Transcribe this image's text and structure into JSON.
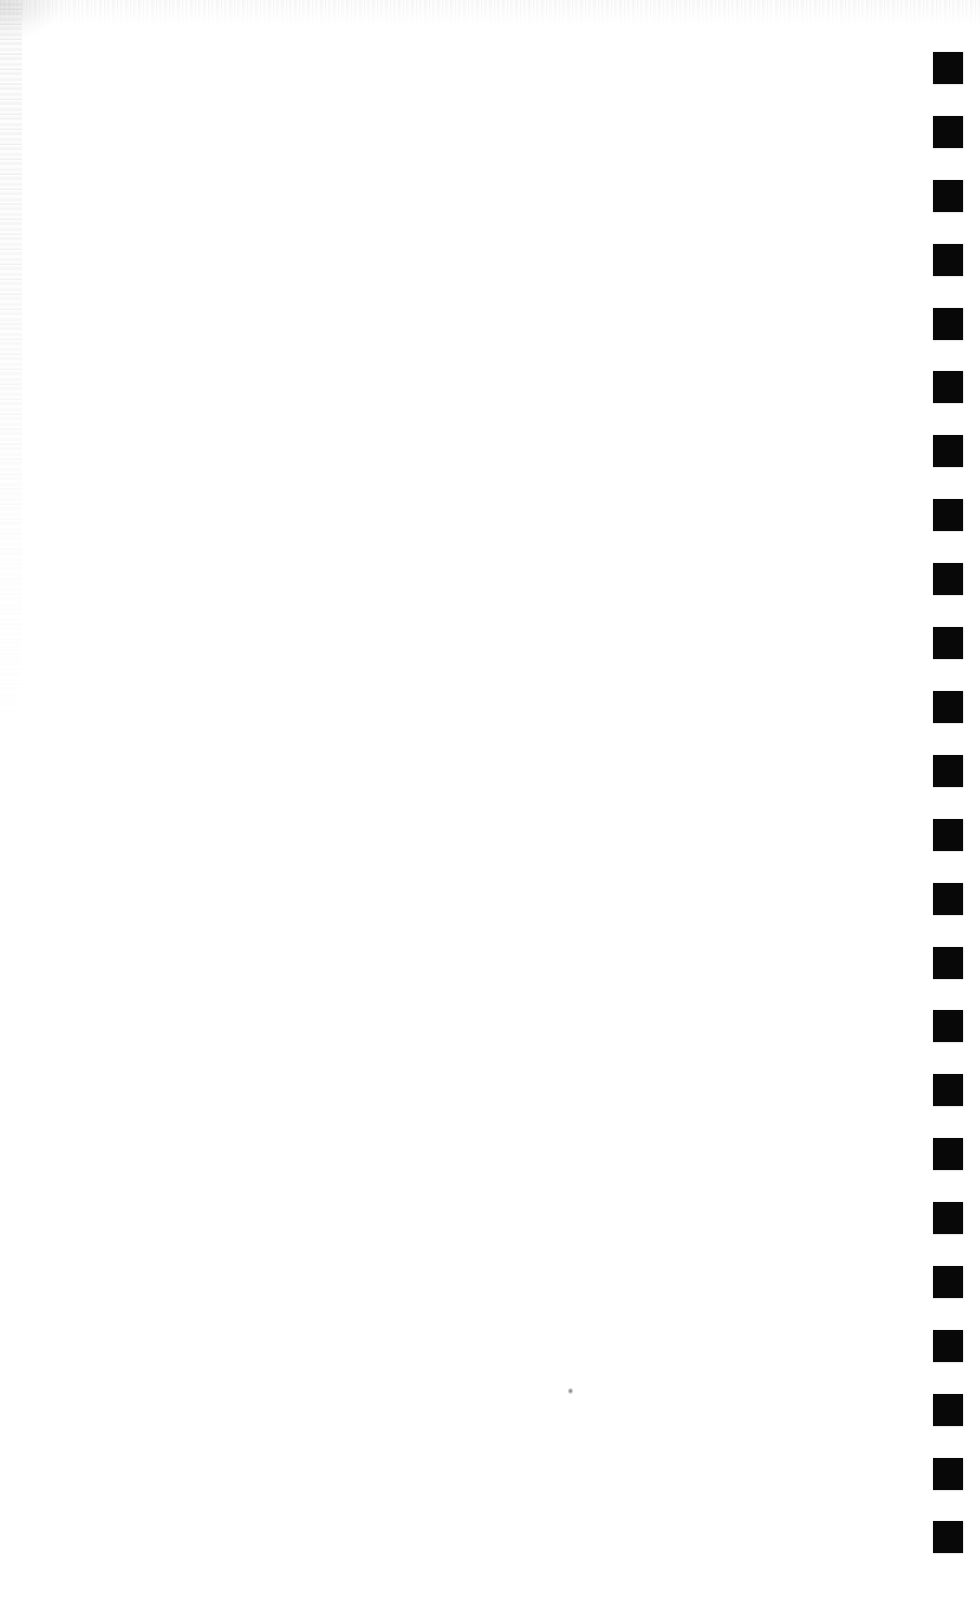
{
  "page": {
    "kind": "scanned-blank-page",
    "width": 980,
    "height": 1603,
    "background_color": "#ffffff",
    "body_text": "",
    "caption": ""
  },
  "registration_strip": {
    "name": "right-margin-registration-marks",
    "mark_color": "#080808",
    "mark_count": 24,
    "mark_width": 30,
    "mark_height": 32,
    "first_mark_top": 52,
    "spacing": 63.9,
    "left": 33,
    "marks": [
      {
        "index": 1,
        "label": "",
        "top": 52
      },
      {
        "index": 2,
        "label": "",
        "top": 116
      },
      {
        "index": 3,
        "label": "",
        "top": 180
      },
      {
        "index": 4,
        "label": "",
        "top": 244
      },
      {
        "index": 5,
        "label": "",
        "top": 308
      },
      {
        "index": 6,
        "label": "",
        "top": 371
      },
      {
        "index": 7,
        "label": "",
        "top": 435
      },
      {
        "index": 8,
        "label": "",
        "top": 499
      },
      {
        "index": 9,
        "label": "",
        "top": 563
      },
      {
        "index": 10,
        "label": "",
        "top": 627
      },
      {
        "index": 11,
        "label": "",
        "top": 691
      },
      {
        "index": 12,
        "label": "",
        "top": 755
      },
      {
        "index": 13,
        "label": "",
        "top": 819
      },
      {
        "index": 14,
        "label": "",
        "top": 883
      },
      {
        "index": 15,
        "label": "",
        "top": 947
      },
      {
        "index": 16,
        "label": "",
        "top": 1010
      },
      {
        "index": 17,
        "label": "",
        "top": 1074
      },
      {
        "index": 18,
        "label": "",
        "top": 1138
      },
      {
        "index": 19,
        "label": "",
        "top": 1202
      },
      {
        "index": 20,
        "label": "",
        "top": 1266
      },
      {
        "index": 21,
        "label": "",
        "top": 1330
      },
      {
        "index": 22,
        "label": "",
        "top": 1394
      },
      {
        "index": 23,
        "label": "",
        "top": 1458
      },
      {
        "index": 24,
        "label": "",
        "top": 1521
      }
    ]
  },
  "artifacts": {
    "speck": {
      "name": "dust-speck",
      "left": 568,
      "top": 1388
    },
    "noise_top": {
      "name": "scan-noise-band-top",
      "color": "#999999"
    },
    "noise_left": {
      "name": "scan-noise-band-left",
      "color": "#999999"
    }
  }
}
